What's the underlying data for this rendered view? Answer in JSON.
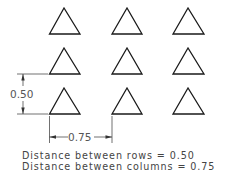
{
  "diagram": {
    "type": "rectangular-array",
    "rows": 3,
    "columns": 3,
    "object": "triangle",
    "row_dimension_label": "0.50",
    "column_dimension_label": "0.75",
    "notes": [
      "Distance between rows = 0.50",
      "Distance between columns = 0.75"
    ]
  }
}
